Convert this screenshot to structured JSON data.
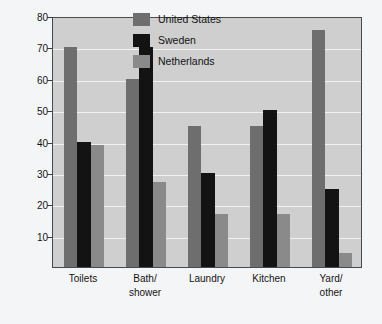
{
  "chart_data": {
    "type": "bar",
    "title": "",
    "xlabel": "",
    "ylabel": "Liters of water per person per day",
    "ylim": [
      0,
      80
    ],
    "yticks": [
      10,
      20,
      30,
      40,
      50,
      60,
      70,
      80
    ],
    "ytick_labels": [
      "10",
      "20",
      "30",
      "40",
      "50",
      "60",
      "70",
      "80"
    ],
    "grid": true,
    "grid_axis": "y",
    "legend_position": "top-center",
    "categories": [
      "Toilets",
      "Bath/shower",
      "Laundry",
      "Kitchen",
      "Yard/other"
    ],
    "category_label_lines": [
      [
        "Toilets"
      ],
      [
        "Bath/",
        "shower"
      ],
      [
        "Laundry"
      ],
      [
        "Kitchen"
      ],
      [
        "Yard/",
        "other"
      ]
    ],
    "series": [
      {
        "name": "United States",
        "color": "#6e6e6e",
        "values": [
          70,
          60,
          45,
          45,
          75.5
        ]
      },
      {
        "name": "Sweden",
        "color": "#131313",
        "values": [
          40,
          70,
          30,
          50,
          25
        ]
      },
      {
        "name": "Netherlands",
        "color": "#8a8a8a",
        "values": [
          39,
          27,
          17,
          17,
          4.5
        ]
      }
    ]
  },
  "colors": {
    "page_background": "#f4f5f6",
    "plot_background": "#cfcfcf",
    "plot_border": "#4a4a4a",
    "gridline": "#f2f2f2",
    "text": "#141414",
    "united_states": "#6e6e6e",
    "sweden": "#131313",
    "netherlands": "#8a8a8a"
  }
}
